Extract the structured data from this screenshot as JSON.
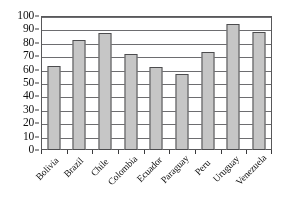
{
  "chart_data": {
    "type": "bar",
    "title": "",
    "subtitle": "",
    "xlabel": "",
    "ylabel": "",
    "categories": [
      "Bolivia",
      "Brazil",
      "Chile",
      "Colombia",
      "Ecuador",
      "Paraguay",
      "Peru",
      "Uruguay",
      "Venezuela"
    ],
    "values": [
      63,
      82,
      87,
      72,
      62,
      57,
      73,
      94,
      88
    ],
    "ylim": [
      0,
      100
    ],
    "ytick_step": 10,
    "yticks": [
      0,
      10,
      20,
      30,
      40,
      50,
      60,
      70,
      80,
      90,
      100
    ],
    "ytick_labels": [
      "0",
      "10",
      "20",
      "30",
      "40",
      "50",
      "60",
      "70",
      "80",
      "90",
      "100"
    ],
    "grid": true,
    "grid_axis": "y",
    "legend": false,
    "legend_position": "none",
    "annotations": [],
    "bar_color": "#c6c6c6",
    "bar_edge_color": "#4c4c4e",
    "axis_color": "#58585a",
    "grid_color": "#6d6d70",
    "text_color": "#111111",
    "background_color": "#ffffff",
    "xtick_label_rotation": -45
  }
}
